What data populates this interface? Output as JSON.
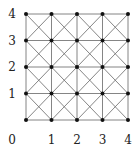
{
  "diagram": {
    "type": "grid graph with diagonals",
    "size": 4,
    "x_labels": [
      "0",
      "1",
      "2",
      "3",
      "4"
    ],
    "y_labels": [
      "1",
      "2",
      "3",
      "4"
    ],
    "origin_label": "0",
    "line_color": "#777777",
    "node_color": "#111111"
  }
}
